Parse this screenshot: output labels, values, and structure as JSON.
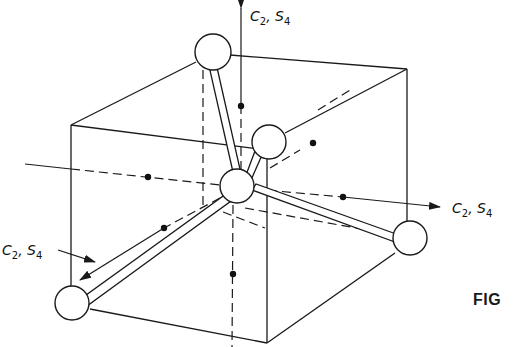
{
  "figure": {
    "caption": "FIG",
    "axes": [
      {
        "id": "vertical",
        "label": "C2, S4",
        "label_main": "C",
        "label_sub1": "2",
        "label_sep": ", S",
        "label_sub2": "4"
      },
      {
        "id": "horizontal-right",
        "label": "C2, S4",
        "label_main": "C",
        "label_sub1": "2",
        "label_sep": ", S",
        "label_sub2": "4"
      },
      {
        "id": "diagonal-front",
        "label": "C2, S4",
        "label_main": "C",
        "label_sub1": "2",
        "label_sep": ", S",
        "label_sub2": "4"
      }
    ],
    "atoms": [
      {
        "id": "central",
        "role": "central atom"
      },
      {
        "id": "top-back-left",
        "role": "ligand"
      },
      {
        "id": "top-front-right",
        "role": "ligand"
      },
      {
        "id": "bottom-back-right",
        "role": "ligand"
      },
      {
        "id": "bottom-front-left",
        "role": "ligand"
      }
    ],
    "colors": {
      "ink": "#1a1a1a",
      "background": "#ffffff"
    }
  }
}
